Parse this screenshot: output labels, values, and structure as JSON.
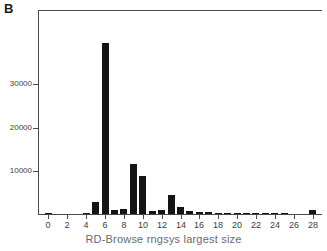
{
  "panel": {
    "label": "B"
  },
  "chart_data": {
    "type": "bar",
    "title": "",
    "xlabel": "RD-Browse rngsys largest size",
    "ylabel": "",
    "categories": [
      0,
      1,
      2,
      3,
      4,
      5,
      6,
      7,
      8,
      9,
      10,
      11,
      12,
      13,
      14,
      15,
      16,
      17,
      18,
      19,
      20,
      21,
      22,
      23,
      24,
      25,
      26,
      27,
      28
    ],
    "values": [
      300,
      0,
      0,
      0,
      180,
      2700,
      39500,
      900,
      1100,
      11600,
      8800,
      750,
      900,
      4300,
      1600,
      600,
      420,
      380,
      330,
      300,
      280,
      260,
      240,
      220,
      200,
      190,
      0,
      0,
      900
    ],
    "xlim": [
      -1,
      29
    ],
    "ylim": [
      0,
      47000
    ],
    "xticks": [
      0,
      2,
      4,
      6,
      8,
      10,
      12,
      14,
      16,
      18,
      20,
      22,
      24,
      26,
      28
    ],
    "xtick_labels": [
      "0",
      "2",
      "4",
      "6",
      "8",
      "10",
      "12",
      "14",
      "16",
      "18",
      "20",
      "22",
      "24",
      "26",
      "28"
    ],
    "yticks": [
      10000,
      20000,
      30000
    ],
    "ytick_labels": [
      "10000",
      "20000",
      "30000"
    ],
    "grid": false,
    "legend": null,
    "bar_color": "#141414",
    "axis_color": "#4a4a4a",
    "text_color": "#3d3d3d"
  }
}
